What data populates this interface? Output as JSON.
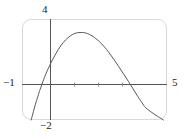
{
  "figure": {
    "kind": "coordinate-plane-graph",
    "frame": {
      "border_color": "#d8d8d8",
      "corner_radius_px": 9,
      "background": "#ffffff"
    },
    "axis_color": "#555555",
    "curve_color": "#595959",
    "tick_color": "#8a8a8a"
  },
  "labels": {
    "y_max": "4",
    "y_min": "−2",
    "x_min": "−1",
    "x_max": "5"
  },
  "chart_data": {
    "type": "line",
    "title": "",
    "xlabel": "",
    "ylabel": "",
    "xlim": [
      -1,
      5
    ],
    "ylim": [
      -2,
      4
    ],
    "grid": false,
    "legend": null,
    "axes": {
      "x_axis_drawn_at_y": 0,
      "y_axis_drawn_at_x": 0,
      "x_tick_values": [
        1,
        2,
        3
      ],
      "y_tick_values": [],
      "x_axis_end_labels": [
        "−1",
        "5"
      ],
      "y_axis_end_labels": [
        "−2",
        "4"
      ]
    },
    "series": [
      {
        "name": "curve",
        "description": "downward-opening curve rising steeply from lower left, peaking near x=1.6, crossing the x-axis near x=-0.25 and x=4.1, exiting frame at lower right",
        "roots": [
          -0.25,
          4.1
        ],
        "vertex": [
          1.6,
          3.2
        ],
        "x": [
          -0.62,
          -0.5,
          -0.4,
          -0.3,
          -0.25,
          -0.1,
          0.0,
          0.2,
          0.4,
          0.6,
          0.8,
          1.0,
          1.2,
          1.4,
          1.6,
          1.8,
          2.0,
          2.2,
          2.4,
          2.6,
          2.8,
          3.0,
          3.2,
          3.4,
          3.6,
          3.8,
          4.0,
          4.1,
          4.3,
          4.5,
          4.7,
          4.85
        ],
        "y": [
          -2.0,
          -1.35,
          -0.85,
          -0.4,
          -0.18,
          0.42,
          0.78,
          1.4,
          1.94,
          2.4,
          2.75,
          3.0,
          3.15,
          3.2,
          3.18,
          3.08,
          2.9,
          2.66,
          2.36,
          2.0,
          1.6,
          1.18,
          0.74,
          0.3,
          -0.16,
          -0.62,
          -1.05,
          -1.25,
          -1.48,
          -1.68,
          -1.86,
          -2.0
        ]
      }
    ]
  }
}
